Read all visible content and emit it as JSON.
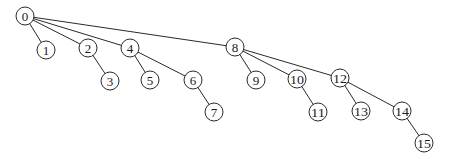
{
  "diagram": {
    "type": "tree",
    "radius": 9,
    "colors": {
      "stroke": "#2a2a2a",
      "text": "#1a1a1a",
      "background": "#ffffff"
    },
    "nodes": [
      {
        "id": 0,
        "label": "0",
        "x": 25,
        "y": 16
      },
      {
        "id": 1,
        "label": "1",
        "x": 46,
        "y": 50
      },
      {
        "id": 2,
        "label": "2",
        "x": 88,
        "y": 48
      },
      {
        "id": 3,
        "label": "3",
        "x": 110,
        "y": 81
      },
      {
        "id": 4,
        "label": "4",
        "x": 130,
        "y": 48
      },
      {
        "id": 5,
        "label": "5",
        "x": 150,
        "y": 80
      },
      {
        "id": 6,
        "label": "6",
        "x": 193,
        "y": 80
      },
      {
        "id": 7,
        "label": "7",
        "x": 214,
        "y": 112
      },
      {
        "id": 8,
        "label": "8",
        "x": 235,
        "y": 47
      },
      {
        "id": 9,
        "label": "9",
        "x": 256,
        "y": 80
      },
      {
        "id": 10,
        "label": "10",
        "x": 297,
        "y": 79
      },
      {
        "id": 11,
        "label": "11",
        "x": 318,
        "y": 112
      },
      {
        "id": 12,
        "label": "12",
        "x": 340,
        "y": 78
      },
      {
        "id": 13,
        "label": "13",
        "x": 361,
        "y": 111
      },
      {
        "id": 14,
        "label": "14",
        "x": 402,
        "y": 111
      },
      {
        "id": 15,
        "label": "15",
        "x": 424,
        "y": 143
      }
    ],
    "edges": [
      [
        0,
        1
      ],
      [
        0,
        2
      ],
      [
        0,
        4
      ],
      [
        0,
        8
      ],
      [
        2,
        3
      ],
      [
        4,
        5
      ],
      [
        4,
        6
      ],
      [
        6,
        7
      ],
      [
        8,
        9
      ],
      [
        8,
        10
      ],
      [
        8,
        12
      ],
      [
        10,
        11
      ],
      [
        12,
        13
      ],
      [
        12,
        14
      ],
      [
        14,
        15
      ]
    ]
  }
}
